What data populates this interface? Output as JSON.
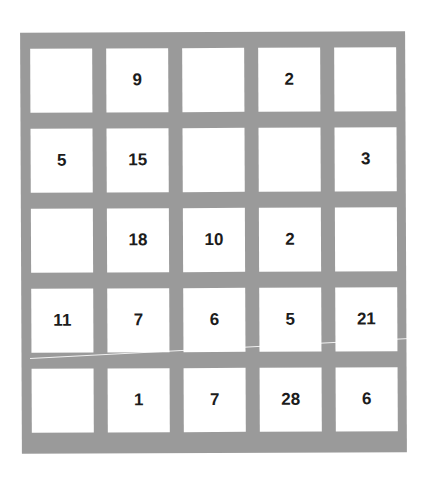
{
  "puzzle": {
    "rows": 5,
    "cols": 5,
    "cells": [
      [
        "",
        "9",
        "",
        "2",
        ""
      ],
      [
        "5",
        "15",
        "",
        "",
        "3"
      ],
      [
        "",
        "18",
        "10",
        "2",
        ""
      ],
      [
        "11",
        "7",
        "6",
        "5",
        "21"
      ],
      [
        "",
        "1",
        "7",
        "28",
        "6"
      ]
    ]
  },
  "colors": {
    "board": "#9a9a9a",
    "cell": "#ffffff",
    "text": "#1c1c1c"
  }
}
